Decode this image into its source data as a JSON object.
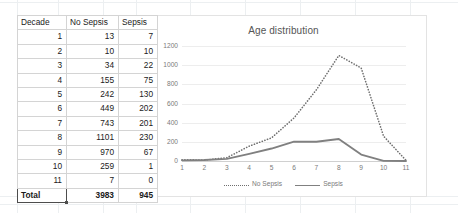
{
  "table": {
    "headers": [
      "Decade",
      "No Sepsis",
      "Sepsis"
    ],
    "rows": [
      [
        "1",
        "13",
        "7"
      ],
      [
        "2",
        "10",
        "10"
      ],
      [
        "3",
        "34",
        "22"
      ],
      [
        "4",
        "155",
        "75"
      ],
      [
        "5",
        "242",
        "130"
      ],
      [
        "6",
        "449",
        "202"
      ],
      [
        "7",
        "743",
        "201"
      ],
      [
        "8",
        "1101",
        "230"
      ],
      [
        "9",
        "970",
        "67"
      ],
      [
        "10",
        "259",
        "1"
      ],
      [
        "11",
        "7",
        "0"
      ]
    ],
    "total": [
      "Total",
      "3983",
      "945"
    ]
  },
  "chart_data": {
    "type": "line",
    "title": "Age distribution",
    "xlabel": "",
    "ylabel": "",
    "x": [
      1,
      2,
      3,
      4,
      5,
      6,
      7,
      8,
      9,
      10,
      11
    ],
    "categories": [
      "1",
      "2",
      "3",
      "4",
      "5",
      "6",
      "7",
      "8",
      "9",
      "10",
      "11"
    ],
    "series": [
      {
        "name": "No Sepsis",
        "style": "dotted",
        "color": "#6f6f6f",
        "values": [
          13,
          10,
          34,
          155,
          242,
          449,
          743,
          1101,
          970,
          259,
          7
        ]
      },
      {
        "name": "Sepsis",
        "style": "solid",
        "color": "#808080",
        "values": [
          7,
          10,
          22,
          75,
          130,
          202,
          201,
          230,
          67,
          1,
          0
        ]
      }
    ],
    "ylim": [
      0,
      1200
    ],
    "yticks": [
      0,
      200,
      400,
      600,
      800,
      1000,
      1200
    ],
    "ytick_labels": [
      "0",
      "200",
      "400",
      "600",
      "800",
      "1000",
      "1200"
    ],
    "grid": true,
    "legend_position": "bottom"
  },
  "colors": {
    "grid": "#ededed",
    "axis": "#d0d0d0",
    "text": "#7a7a7a",
    "title": "#555555"
  }
}
